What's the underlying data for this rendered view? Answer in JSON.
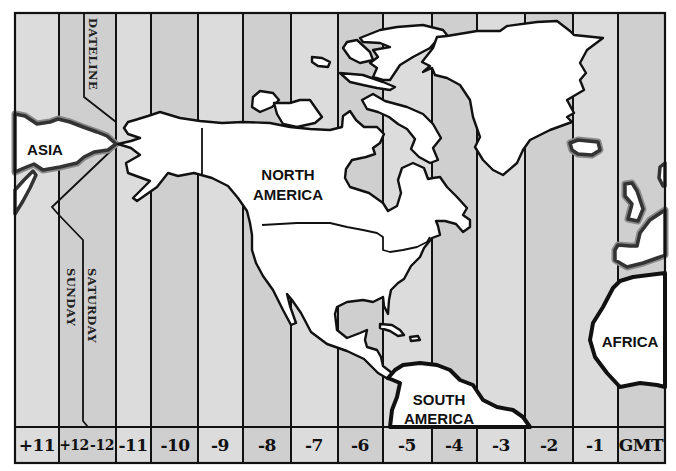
{
  "timezone_labels": [
    "+11",
    "+12",
    "-12",
    "-11",
    "-10",
    "-9",
    "-8",
    "-7",
    "-6",
    "-5",
    "-4",
    "-3",
    "-2",
    "-1",
    "GMT"
  ],
  "zone_shading": [
    "light",
    "dark",
    "light",
    "dark",
    "light",
    "dark",
    "light",
    "dark",
    "light",
    "dark",
    "light",
    "dark",
    "light",
    "dark"
  ],
  "dateline": {
    "label": "DATELINE",
    "west_day": "SUNDAY",
    "east_day": "SATURDAY"
  },
  "regions": {
    "asia": "ASIA",
    "north_america": [
      "NORTH",
      "AMERICA"
    ],
    "south_america": [
      "SOUTH",
      "AMERICA"
    ],
    "africa": "AFRICA"
  },
  "colors": {
    "stripe_light": "#dcdcdc",
    "stripe_dark": "#cfcfcf",
    "land": "#ffffff",
    "outline": "#111111"
  }
}
